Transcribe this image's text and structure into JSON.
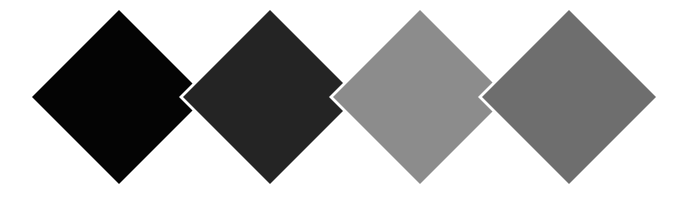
{
  "image": {
    "title": "Grayscale Diamond Swatch Strip",
    "width": 675,
    "height": 199,
    "background_color": "#ffffff",
    "description": "Four overlapping diamond (rotated square) shapes arranged left to right in a horizontal row on a plain white background, progressing from pure black to medium gray. Each diamond is separated from its neighbour by a thin white chevron-shaped gap.",
    "shape_count": 4,
    "shape_type": "diamond",
    "arrangement": "horizontal-row-overlapping",
    "gap_color": "#ffffff",
    "gap_width_px": 4
  },
  "swatches": [
    {
      "index": 1,
      "name": "diamond-black",
      "label": "Black",
      "color": "#040404",
      "grayscale_value": 4,
      "center_x": 119,
      "center_y": 97,
      "half_width": 87,
      "half_height": 87,
      "top_vertex_y": 10,
      "bottom_vertex_y": 184,
      "left_vertex_x": 32,
      "right_vertex_x": 206
    },
    {
      "index": 2,
      "name": "diamond-near-black",
      "label": "Near Black",
      "color": "#242424",
      "grayscale_value": 36,
      "center_x": 270,
      "center_y": 97,
      "half_width": 87,
      "half_height": 87,
      "top_vertex_y": 10,
      "bottom_vertex_y": 184,
      "left_vertex_x": 183,
      "right_vertex_x": 357
    },
    {
      "index": 3,
      "name": "diamond-light-gray",
      "label": "Light Gray",
      "color": "#8c8c8c",
      "grayscale_value": 140,
      "center_x": 420,
      "center_y": 97,
      "half_width": 87,
      "half_height": 87,
      "top_vertex_y": 10,
      "bottom_vertex_y": 184,
      "left_vertex_x": 333,
      "right_vertex_x": 507
    },
    {
      "index": 4,
      "name": "diamond-medium-gray",
      "label": "Medium Gray",
      "color": "#6e6e6e",
      "grayscale_value": 110,
      "center_x": 569,
      "center_y": 97,
      "half_width": 87,
      "half_height": 87,
      "top_vertex_y": 10,
      "bottom_vertex_y": 184,
      "left_vertex_x": 482,
      "right_vertex_x": 656
    }
  ]
}
